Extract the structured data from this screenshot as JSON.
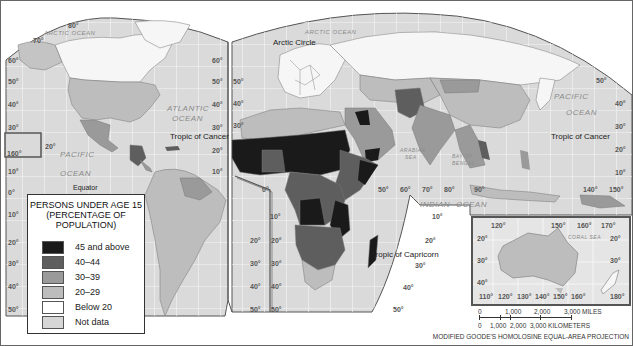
{
  "legend": {
    "title_lines": [
      "PERSONS UNDER AGE 15",
      "(PERCENTAGE OF",
      "POPULATION)"
    ],
    "items": [
      {
        "label": "45 and above",
        "color": "#1a1a1a"
      },
      {
        "label": "40–44",
        "color": "#5e5e5e"
      },
      {
        "label": "30–39",
        "color": "#9a9a9a"
      },
      {
        "label": "20–29",
        "color": "#bdbdbd"
      },
      {
        "label": "Below 20",
        "color": "#ffffff"
      },
      {
        "label": "Not data",
        "color": "#d6d6d6"
      }
    ]
  },
  "labels": {
    "arctic_ocean_left": "ARCTIC OCEAN",
    "arctic_ocean_right": "ARCTIC OCEAN",
    "arctic_circle": "Arctic Circle",
    "atlantic_1": "ATLANTIC",
    "atlantic_2": "OCEAN",
    "pacific_left_1": "PACIFIC",
    "pacific_left_2": "OCEAN",
    "pacific_right_1": "PACIFIC",
    "pacific_right_2": "OCEAN",
    "indian_1": "INDIAN",
    "indian_2": "OCEAN",
    "arabian_sea_1": "ARABIAN",
    "arabian_sea_2": "SEA",
    "bay_bengal_1": "BAY OF",
    "bay_bengal_2": "BENGAL",
    "coral_sea": "CORAL SEA",
    "tropic_cancer_left": "Tropic of Cancer",
    "tropic_cancer_right": "Tropic of Cancer",
    "tropic_capricorn": "Tropic of Capricorn",
    "equator": "Equator"
  },
  "degrees": {
    "left_lat": [
      "60°",
      "50°",
      "40°",
      "30°",
      "20°",
      "10°",
      "0°",
      "10°",
      "20°",
      "30°",
      "40°",
      "50°"
    ],
    "top_left": [
      "80°",
      "70°"
    ],
    "mid_lat": [
      "60°",
      "50°",
      "40°",
      "30°",
      "20°",
      "10°"
    ],
    "lon_160": "160°",
    "lat_20_hawaii": "20°",
    "right_lat_a": [
      "50°",
      "40°",
      "30°",
      "20°",
      "10°"
    ],
    "africa_lon": [
      "0°",
      "50°",
      "60°",
      "70°",
      "80°",
      "90°",
      "140°",
      "150°"
    ],
    "sa_right": [
      "10°",
      "20°",
      "30°",
      "40°",
      "50°"
    ],
    "africa_left": [
      "10°",
      "20°",
      "30°",
      "40°",
      "50°"
    ],
    "indian_right": [
      "10°",
      "20°",
      "30°",
      "40°",
      "50°"
    ],
    "right_10s": "10°",
    "inset_top": [
      "120°",
      "150°",
      "160°",
      "170°"
    ],
    "inset_lat_left": [
      "20°",
      "30°",
      "40°"
    ],
    "inset_lat_right": [
      "20°",
      "30°"
    ],
    "inset_bottom": [
      "110°",
      "120°",
      "130°",
      "140°",
      "150°",
      "160°",
      "180°"
    ]
  },
  "scale": {
    "miles": [
      "0",
      "1,000",
      "2,000",
      "3,000 MILES"
    ],
    "km": [
      "0",
      "1,000",
      "2,000",
      "3,000 KILOMETERS"
    ]
  },
  "projection": "MODIFIED GOODE'S HOMOLOSINE EQUAL-AREA PROJECTION",
  "colors": {
    "ocean": "#dcdcdc",
    "grid": "#f4f4f4",
    "border": "#444444"
  }
}
